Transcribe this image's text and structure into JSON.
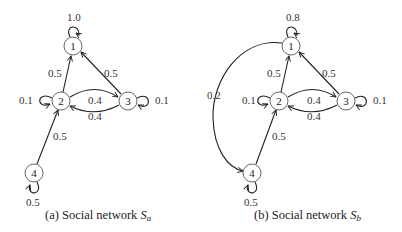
{
  "figure": {
    "panels": [
      {
        "id": "a",
        "caption_prefix": "(a) Social network ",
        "caption_symbol": "S",
        "caption_sub": "a",
        "nodes": [
          {
            "id": "1",
            "label": "1"
          },
          {
            "id": "2",
            "label": "2"
          },
          {
            "id": "3",
            "label": "3"
          },
          {
            "id": "4",
            "label": "4"
          }
        ],
        "edges": [
          {
            "from": "1",
            "to": "1",
            "weight": "1.0"
          },
          {
            "from": "2",
            "to": "1",
            "weight": "0.5"
          },
          {
            "from": "3",
            "to": "1",
            "weight": "0.5"
          },
          {
            "from": "2",
            "to": "2",
            "weight": "0.1"
          },
          {
            "from": "2",
            "to": "3",
            "weight": "0.4"
          },
          {
            "from": "3",
            "to": "2",
            "weight": "0.4"
          },
          {
            "from": "3",
            "to": "3",
            "weight": "0.1"
          },
          {
            "from": "4",
            "to": "2",
            "weight": "0.5"
          },
          {
            "from": "4",
            "to": "4",
            "weight": "0.5"
          }
        ]
      },
      {
        "id": "b",
        "caption_prefix": "(b) Social network ",
        "caption_symbol": "S",
        "caption_sub": "b",
        "nodes": [
          {
            "id": "1",
            "label": "1"
          },
          {
            "id": "2",
            "label": "2"
          },
          {
            "id": "3",
            "label": "3"
          },
          {
            "id": "4",
            "label": "4"
          }
        ],
        "edges": [
          {
            "from": "1",
            "to": "1",
            "weight": "0.8"
          },
          {
            "from": "1",
            "to": "4",
            "weight": "0.2"
          },
          {
            "from": "2",
            "to": "1",
            "weight": "0.5"
          },
          {
            "from": "3",
            "to": "1",
            "weight": "0.5"
          },
          {
            "from": "2",
            "to": "2",
            "weight": "0.1"
          },
          {
            "from": "2",
            "to": "3",
            "weight": "0.4"
          },
          {
            "from": "3",
            "to": "2",
            "weight": "0.4"
          },
          {
            "from": "3",
            "to": "3",
            "weight": "0.1"
          },
          {
            "from": "4",
            "to": "2",
            "weight": "0.5"
          },
          {
            "from": "4",
            "to": "4",
            "weight": "0.5"
          }
        ]
      }
    ]
  }
}
